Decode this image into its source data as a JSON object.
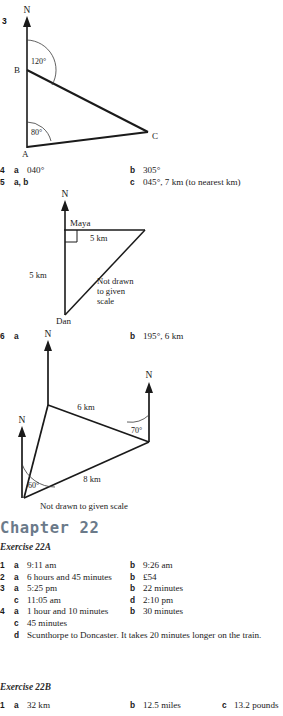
{
  "page": {
    "width": 283,
    "height": 716,
    "background": "#ffffff",
    "ink": "#1a1a1a"
  },
  "diagram_q3": {
    "number": "3",
    "north_label": "N",
    "vertices": [
      {
        "name": "B",
        "label": "B"
      },
      {
        "name": "A",
        "label": "A"
      },
      {
        "name": "C",
        "label": "C"
      }
    ],
    "angles": [
      "120°",
      "80°"
    ]
  },
  "answers_4_5": [
    {
      "num": "4",
      "a_letter": "a",
      "a_text": "040°",
      "b_letter": "b",
      "b_text": "305°"
    },
    {
      "num": "5",
      "a_letter": "a, b",
      "a_text": "",
      "b_letter": "c",
      "b_text": "045°, 7 km (to nearest km)"
    }
  ],
  "diagram_q5": {
    "north_label": "N",
    "top_label": "Maya",
    "bottom_label": "Dan",
    "side_top": "5 km",
    "side_left": "5 km",
    "note_line1": "Not drawn",
    "note_line2": "to given",
    "note_line3": "scale",
    "right_angle": "right-angle-marker"
  },
  "answer_6": {
    "num": "6",
    "a_letter": "a",
    "b_letter": "b",
    "b_text": "195°, 6 km"
  },
  "diagram_q6": {
    "north_labels": [
      "N",
      "N",
      "N"
    ],
    "side_top": "6 km",
    "side_bottom": "8 km",
    "angle_right": "70°",
    "angle_left": "60°",
    "note": "Not drawn to given scale"
  },
  "chapter": {
    "title": "Chapter 22",
    "color": "#6b7a8a"
  },
  "exercise_22a": {
    "title": "Exercise 22A",
    "rows": [
      {
        "num": "1",
        "cells": [
          {
            "letter": "a",
            "text": "9:11 am",
            "col": "A"
          },
          {
            "letter": "b",
            "text": "9:26 am",
            "col": "B"
          }
        ]
      },
      {
        "num": "2",
        "cells": [
          {
            "letter": "a",
            "text": "6 hours and 45 minutes",
            "col": "A"
          },
          {
            "letter": "b",
            "text": "£54",
            "col": "B"
          }
        ]
      },
      {
        "num": "3",
        "cells": [
          {
            "letter": "a",
            "text": "5:25 pm",
            "col": "A"
          },
          {
            "letter": "b",
            "text": "22 minutes",
            "col": "B"
          }
        ]
      },
      {
        "num": "",
        "cells": [
          {
            "letter": "c",
            "text": "11:05 am",
            "col": "A"
          },
          {
            "letter": "d",
            "text": "2:10 pm",
            "col": "B"
          }
        ]
      },
      {
        "num": "4",
        "cells": [
          {
            "letter": "a",
            "text": "1 hour and 10 minutes",
            "col": "A"
          },
          {
            "letter": "b",
            "text": "30 minutes",
            "col": "B"
          }
        ]
      },
      {
        "num": "",
        "cells": [
          {
            "letter": "c",
            "text": "45 minutes",
            "col": "A"
          }
        ]
      }
    ],
    "row4d": {
      "letter": "d",
      "text": "Scunthorpe to Doncaster. It takes 20 minutes longer on the train."
    }
  },
  "exercise_22b": {
    "title": "Exercise 22B",
    "rows": [
      {
        "num": "1",
        "cells": [
          {
            "letter": "a",
            "text": "32 km",
            "col": "A"
          },
          {
            "letter": "b",
            "text": "12.5 miles",
            "col": "B"
          },
          {
            "letter": "c",
            "text": "13.2 pounds",
            "col": "C"
          }
        ]
      }
    ]
  }
}
